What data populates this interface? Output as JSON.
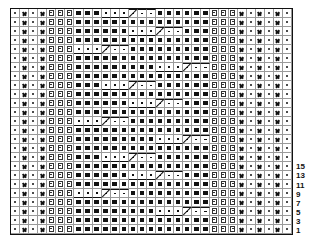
{
  "chart_data": {
    "type": "table",
    "columns": 31,
    "rows": 25,
    "symbols": {
      "dot": "purl/dot stitch",
      "cross": "twisted/crossed stitch",
      "box": "slip/edge stitch (boxed line)",
      "knit": "knit (filled square)",
      "cable": "cable cross stitch (white cell with dot)"
    },
    "left_border": [
      "dot",
      "cross",
      "dot",
      "cross",
      "box",
      "box",
      "box"
    ],
    "middle_width": 15,
    "right_border": [
      "box",
      "box",
      "box",
      "cross",
      "dot",
      "cross",
      "dot",
      "cross",
      "dot"
    ],
    "cables_from_bottom": [
      {
        "row": 3,
        "start": 9,
        "end": 14
      },
      {
        "row": 5,
        "start": 0,
        "end": 5
      },
      {
        "row": 7,
        "start": 6,
        "end": 11
      },
      {
        "row": 9,
        "start": 3,
        "end": 8
      },
      {
        "row": 11,
        "start": 9,
        "end": 14
      },
      {
        "row": 13,
        "start": 0,
        "end": 5
      },
      {
        "row": 15,
        "start": 6,
        "end": 11
      },
      {
        "row": 17,
        "start": 3,
        "end": 8
      },
      {
        "row": 19,
        "start": 9,
        "end": 14
      },
      {
        "row": 21,
        "start": 0,
        "end": 5
      },
      {
        "row": 23,
        "start": 6,
        "end": 11
      },
      {
        "row": 25,
        "start": 3,
        "end": 8
      }
    ],
    "row_labels": [
      "15",
      "13",
      "11",
      "9",
      "7",
      "5",
      "3",
      "1"
    ]
  }
}
